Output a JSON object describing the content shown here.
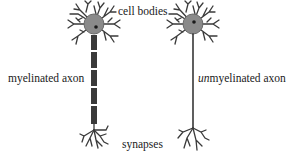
{
  "diagram": {
    "labels": {
      "cell_bodies": "cell bodies",
      "myelinated_axon": "myelinated axon",
      "unmyelinated_prefix": "un",
      "unmyelinated_rest": "myelinated axon",
      "synapses": "synapses"
    },
    "neurons": [
      {
        "name": "myelinated neuron",
        "axon": "myelinated"
      },
      {
        "name": "unmyelinated neuron",
        "axon": "unmyelinated"
      }
    ],
    "colors": {
      "cell_body": "#8a8a8a",
      "line": "#2a2a2a",
      "myelin": "#3a3a3a",
      "nucleus": "#1a1a1a"
    }
  }
}
